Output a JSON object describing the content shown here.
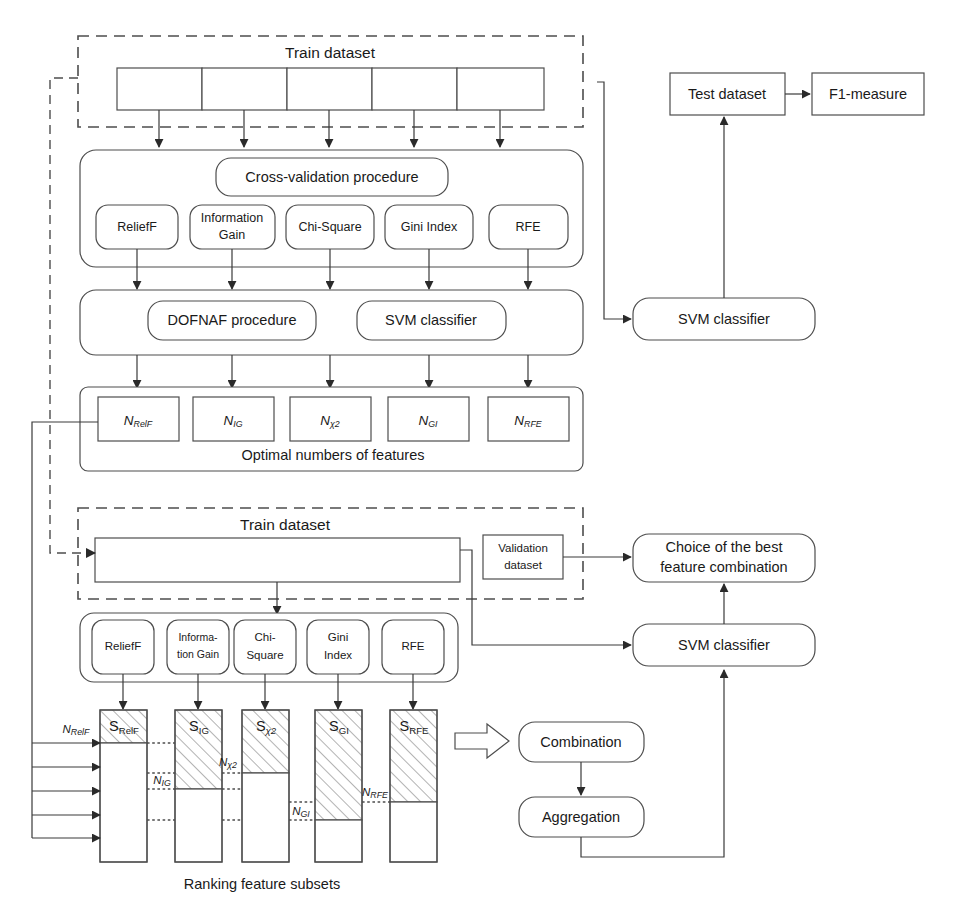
{
  "diagram": {
    "stage": {
      "width": 955,
      "height": 921
    },
    "colors": {
      "stroke": "#4d4d4d",
      "line": "#3a3a3a",
      "background": "#ffffff",
      "hatch": "#6b6b6b"
    }
  },
  "stage1": {
    "train_dataset_label": "Train dataset",
    "folds": [
      "",
      "",
      "",
      "",
      ""
    ],
    "cross_validation_label": "Cross-validation procedure",
    "selectors": [
      {
        "id": "relieff",
        "label": "ReliefF"
      },
      {
        "id": "information-gain",
        "label": "Information Gain",
        "line1": "Information",
        "line2": "Gain"
      },
      {
        "id": "chi-square",
        "label": "Chi-Square"
      },
      {
        "id": "gini-index",
        "label": "Gini Index"
      },
      {
        "id": "rfe",
        "label": "RFE"
      }
    ],
    "dofnaf_label": "DOFNAF procedure",
    "svm_label": "SVM classifier",
    "optimal_numbers_label": "Optimal numbers of features",
    "optimal_numbers": [
      {
        "id": "n-relieff",
        "base": "N",
        "sub": "RelF"
      },
      {
        "id": "n-ig",
        "base": "N",
        "sub": "IG"
      },
      {
        "id": "n-chi2",
        "base": "N",
        "sub": "χ2"
      },
      {
        "id": "n-gi",
        "base": "N",
        "sub": "GI"
      },
      {
        "id": "n-rfe",
        "base": "N",
        "sub": "RFE"
      }
    ]
  },
  "stage2": {
    "train_dataset_label": "Train dataset",
    "validation_dataset_label": "Validation dataset",
    "validation_line1": "Validation",
    "validation_line2": "dataset",
    "selectors": [
      {
        "id": "relieff",
        "label": "ReliefF",
        "line1": "ReliefF",
        "line2": ""
      },
      {
        "id": "information-gain",
        "label": "Information Gain",
        "line1": "Informa-",
        "line2": "tion Gain"
      },
      {
        "id": "chi-square",
        "label": "Chi-Square",
        "line1": "Chi-",
        "line2": "Square"
      },
      {
        "id": "gini-index",
        "label": "Gini Index",
        "line1": "Gini",
        "line2": "Index"
      },
      {
        "id": "rfe",
        "label": "RFE",
        "line1": "RFE",
        "line2": ""
      }
    ],
    "ranking_label": "Ranking feature subsets",
    "bars": [
      {
        "id": "s-relieff",
        "base": "S",
        "sub": "RelF",
        "n_base": "N",
        "n_sub": "RelF",
        "hatch_fraction": 0.22
      },
      {
        "id": "s-ig",
        "base": "S",
        "sub": "IG",
        "n_base": "N",
        "n_sub": "IG",
        "hatch_fraction": 0.52
      },
      {
        "id": "s-chi2",
        "base": "S",
        "sub": "χ2",
        "n_base": "N",
        "n_sub": "χ2",
        "hatch_fraction": 0.42
      },
      {
        "id": "s-gi",
        "base": "S",
        "sub": "GI",
        "n_base": "N",
        "n_sub": "GI",
        "hatch_fraction": 0.82
      },
      {
        "id": "s-rfe",
        "base": "S",
        "sub": "RFE",
        "n_base": "N",
        "n_sub": "RFE",
        "hatch_fraction": 0.66
      }
    ],
    "combination_label": "Combination",
    "aggregation_label": "Aggregation"
  },
  "right": {
    "test_dataset_label": "Test dataset",
    "f1_measure_label": "F1-measure",
    "svm_top_label": "SVM classifier",
    "choice_label": "Choice of the best feature combination",
    "choice_line1": "Choice of the best",
    "choice_line2": "feature combination",
    "svm_bottom_label": "SVM classifier"
  }
}
